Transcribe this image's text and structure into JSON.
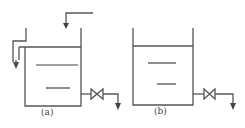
{
  "diagram": {
    "type": "tank-flow-schematic",
    "line_color": "#555555",
    "tanks": [
      {
        "id": "a",
        "label": "(a)",
        "has_inlet": true,
        "has_overflow_pipe": true,
        "has_outlet_valve": true,
        "water_level_marks": 2
      },
      {
        "id": "b",
        "label": "(b)",
        "has_inlet": false,
        "has_overflow_pipe": false,
        "has_outlet_valve": true,
        "water_level_marks": 2
      }
    ]
  }
}
